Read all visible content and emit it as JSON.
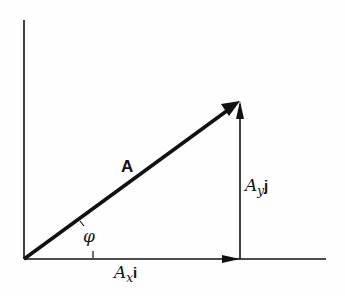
{
  "diagram": {
    "title": "",
    "vector_label": "A",
    "angle_label": "φ",
    "x_component": {
      "symbol": "A",
      "subscript": "x",
      "unit": "i"
    },
    "y_component": {
      "symbol": "A",
      "subscript": "y",
      "unit": "j"
    },
    "colors": {
      "ink": "#111111",
      "background": "#fefefe"
    },
    "geometry": {
      "origin": [
        24,
        259
      ],
      "tip": [
        240,
        101
      ],
      "x_axis_end": [
        326,
        259
      ],
      "y_axis_top": [
        24,
        20
      ]
    }
  }
}
